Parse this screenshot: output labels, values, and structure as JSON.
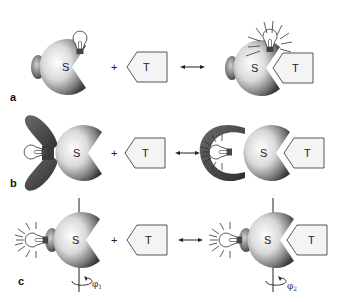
{
  "figure": {
    "panels": [
      {
        "id": "a",
        "label": "a",
        "left": {
          "body": "S",
          "reporter": "bulb-off"
        },
        "plus": "+",
        "target": "T",
        "arrow": "↔",
        "right": {
          "body": "S",
          "target": "T",
          "reporter": "bulb-on"
        }
      },
      {
        "id": "b",
        "label": "b",
        "left": {
          "body": "S",
          "reporter": "bulb-off"
        },
        "plus": "+",
        "target": "T",
        "arrow": "↔",
        "right": {
          "body": "S",
          "target": "T",
          "reporter": "bulb-on"
        }
      },
      {
        "id": "c",
        "label": "c",
        "left": {
          "body": "S",
          "reporter": "bulb-on",
          "angle": "φ1"
        },
        "plus": "+",
        "target": "T",
        "arrow": "↔",
        "right": {
          "body": "S",
          "target": "T",
          "reporter": "bulb-on",
          "angle": "φ2"
        }
      }
    ],
    "angle_sub": {
      "one": "1",
      "two": "2"
    },
    "phi": "φ"
  }
}
